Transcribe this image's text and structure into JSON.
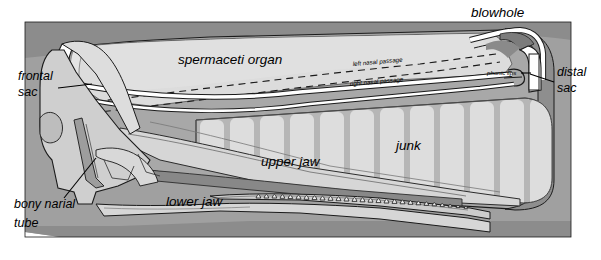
{
  "figure": {
    "width": 601,
    "height": 260,
    "background_color": "#ffffff"
  },
  "palette": {
    "page_background": "#ffffff",
    "body_background_gray": "#9b9b9b",
    "body_background_dark": "#8a8a8a",
    "spermaceti_fill": "#d9d9d9",
    "spermaceti_fill_light": "#e2e2e2",
    "junk_fill": "#b6b6b6",
    "junk_stripe": "#dcdcdc",
    "skull_fill": "#cfcfcf",
    "skull_fill_light": "#dddddd",
    "jaw_fill": "#d3d3d3",
    "jaw_dark_fill": "#8f8f8f",
    "sac_white": "#ffffff",
    "teeth_fill": "#e8e8e8",
    "outline_stroke": "#1a1a1a",
    "label_text": "#000000"
  },
  "labels": {
    "blowhole": "blowhole",
    "spermaceti_organ": "spermaceti organ",
    "frontal_sac": "frontal\nsac",
    "frontal_sac_line1": "frontal",
    "frontal_sac_line2": "sac",
    "distal_sac_line1": "distal",
    "distal_sac_line2": "sac",
    "bony_narial_tube_line1": "bony narial",
    "bony_narial_tube_line2": "tube",
    "left_nasal_passage": "left nasal passage",
    "right_nasal_passage": "right nasal passage",
    "phonic_lips": "phonic lips",
    "junk": "junk",
    "upper_jaw": "upper jaw",
    "lower_jaw": "lower jaw"
  },
  "anatomy_parts": [
    {
      "name": "blowhole",
      "label": "blowhole",
      "description": "S-shaped opening at the upper left of the snout tip",
      "label_position": {
        "x": 471,
        "y": 16
      }
    },
    {
      "name": "spermaceti-organ",
      "label": "spermaceti organ",
      "description": "large light-gray oil-filled organ filling the upper forehead",
      "label_position": {
        "x": 178,
        "y": 62
      }
    },
    {
      "name": "frontal-sac",
      "label": "frontal sac",
      "description": "white curved air sac at the rear of the spermaceti organ against the skull",
      "label_position": {
        "x": 18,
        "y": 80
      }
    },
    {
      "name": "distal-sac",
      "label": "distal sac",
      "description": "white vertical air sac at the front tip of the snout",
      "label_position": {
        "x": 558,
        "y": 78
      }
    },
    {
      "name": "bony-narial-tube",
      "label": "bony narial tube",
      "description": "bony passage through the skull below the frontal sac",
      "label_position": {
        "x": 20,
        "y": 205
      }
    },
    {
      "name": "left-nasal-passage",
      "label": "left nasal passage",
      "description": "dashed line running through the spermaceti organ to the blowhole",
      "label_position": {
        "x": 355,
        "y": 64
      }
    },
    {
      "name": "right-nasal-passage",
      "label": "right nasal passage",
      "description": "solid white channel running beneath the spermaceti organ to the phonic lips",
      "label_position": {
        "x": 352,
        "y": 83
      }
    },
    {
      "name": "phonic-lips",
      "label": "phonic lips",
      "description": "sound-producing structure at the front end of the right nasal passage",
      "label_position": {
        "x": 489,
        "y": 72
      }
    },
    {
      "name": "junk",
      "label": "junk",
      "description": "segmented striped body of fatty lenses below the spermaceti organ",
      "label_position": {
        "x": 396,
        "y": 147
      }
    },
    {
      "name": "upper-jaw",
      "label": "upper jaw",
      "description": "rostrum of the skull extending forward under the junk",
      "label_position": {
        "x": 261,
        "y": 163
      }
    },
    {
      "name": "lower-jaw",
      "label": "lower jaw",
      "description": "long narrow mandible bearing a row of conical teeth",
      "label_position": {
        "x": 166,
        "y": 202
      }
    }
  ],
  "teeth": {
    "count": 27,
    "description": "row of conical teeth along the lower jaw"
  },
  "junk_segments": {
    "count": 12,
    "description": "vertical rounded-top light stripes inside the junk"
  },
  "nasal_passages": {
    "left": {
      "style": "dashed",
      "label": "left nasal passage"
    },
    "right": {
      "style": "solid-white-channel",
      "label": "right nasal passage"
    }
  }
}
